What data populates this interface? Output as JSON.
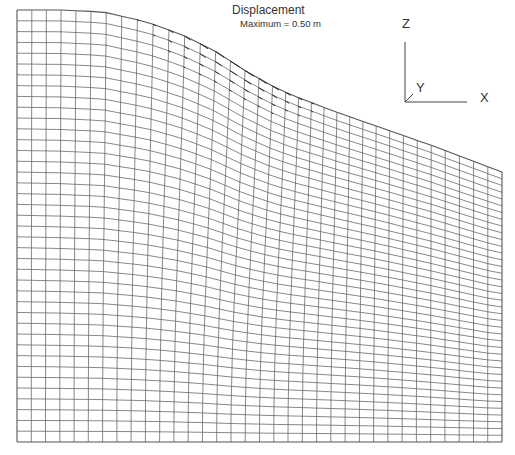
{
  "figure": {
    "title": "Displacement",
    "subtitle": "Maximum = 0.50 m"
  },
  "axes_triad": {
    "z_label": "Z",
    "y_label": "Y",
    "x_label": "X"
  },
  "mesh": {
    "columns": 34,
    "rows": 40,
    "left_x": 17,
    "right_x": 502,
    "bottom_y": 442,
    "top_profile": [
      [
        17,
        10
      ],
      [
        60,
        10
      ],
      [
        100,
        12
      ],
      [
        140,
        22
      ],
      [
        170,
        34
      ],
      [
        200,
        50
      ],
      [
        230,
        70
      ],
      [
        255,
        84
      ],
      [
        280,
        95
      ],
      [
        330,
        112
      ],
      [
        380,
        128
      ],
      [
        430,
        145
      ],
      [
        470,
        160
      ],
      [
        502,
        172
      ]
    ],
    "line_color": "#555555",
    "vector_color": "#222222"
  }
}
